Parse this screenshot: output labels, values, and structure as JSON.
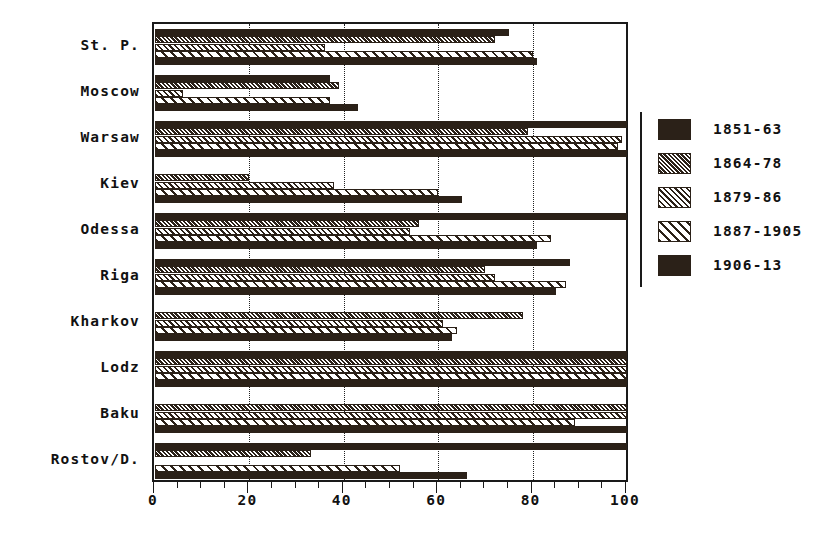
{
  "chart_data": {
    "type": "bar",
    "orientation": "horizontal",
    "title": "",
    "xlabel": "",
    "ylabel": "",
    "xlim": [
      0,
      100
    ],
    "xticks": [
      0,
      20,
      40,
      60,
      80,
      100
    ],
    "xtick_labels": [
      "0",
      "20",
      "40",
      "60",
      "80",
      "100"
    ],
    "minor_tick_step": 5,
    "grid": "vertical dotted gridlines at major ticks",
    "legend_position": "right",
    "categories": [
      "St. P.",
      "Moscow",
      "Warsaw",
      "Kiev",
      "Odessa",
      "Riga",
      "Kharkov",
      "Lodz",
      "Baku",
      "Rostov/D."
    ],
    "series": [
      {
        "name": "1851-63",
        "pattern": "solid",
        "color": "#2b2118",
        "values": [
          75,
          37,
          100,
          0,
          100,
          88,
          0,
          100,
          0,
          100
        ]
      },
      {
        "name": "1864-78",
        "pattern": "dense-hatch",
        "color": "#2b2118",
        "values": [
          72,
          39,
          79,
          20,
          56,
          70,
          78,
          100,
          100,
          33
        ]
      },
      {
        "name": "1879-86",
        "pattern": "medium-hatch",
        "color": "#2b2118",
        "values": [
          36,
          6,
          99,
          38,
          54,
          72,
          61,
          100,
          100,
          0
        ]
      },
      {
        "name": "1887-1905",
        "pattern": "sparse-hatch",
        "color": "#2b2118",
        "values": [
          80,
          37,
          98,
          60,
          84,
          87,
          64,
          100,
          89,
          52
        ]
      },
      {
        "name": "1906-13",
        "pattern": "solid",
        "color": "#2b2118",
        "values": [
          81,
          43,
          100,
          65,
          81,
          85,
          63,
          100,
          100,
          66
        ]
      }
    ]
  }
}
